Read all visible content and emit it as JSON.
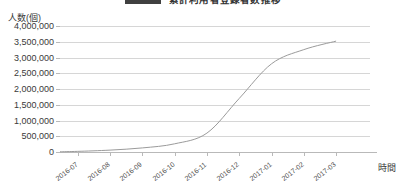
{
  "title": {
    "text": "累計利用者登録者数推移",
    "legend_swatch_color": "#404040"
  },
  "axes": {
    "y_caption": "人数(個)",
    "x_caption": "時間",
    "y_ticks": [
      "0",
      "500,000",
      "1,000,000",
      "1,500,000",
      "2,000,000",
      "2,500,000",
      "3,000,000",
      "3,500,000",
      "4,000,000"
    ],
    "x_ticks": [
      "2016-07",
      "2016-08",
      "2016-09",
      "2016-10",
      "2016-11",
      "2016-12",
      "2017-01",
      "2017-02",
      "2017-03"
    ]
  },
  "colors": {
    "gridline": "#d6d6d6",
    "axis": "#b9b9b9",
    "series": "#9b9b9b"
  },
  "chart_data": {
    "type": "line",
    "title": "累計利用者登録者数推移",
    "xlabel": "時間",
    "ylabel": "人数(個)",
    "ylim": [
      0,
      4000000
    ],
    "ytick_step": 500000,
    "grid": true,
    "legend_position": "top",
    "categories": [
      "2016-07",
      "2016-08",
      "2016-09",
      "2016-10",
      "2016-11",
      "2016-12",
      "2017-01",
      "2017-02",
      "2017-03"
    ],
    "series": [
      {
        "name": "累計利用者登録者数",
        "values": [
          20000,
          60000,
          130000,
          260000,
          600000,
          1700000,
          2800000,
          3250000,
          3520000
        ]
      }
    ],
    "annotations": [
      "S字カーブ(ロジスティック曲線)状の累積推移"
    ]
  }
}
